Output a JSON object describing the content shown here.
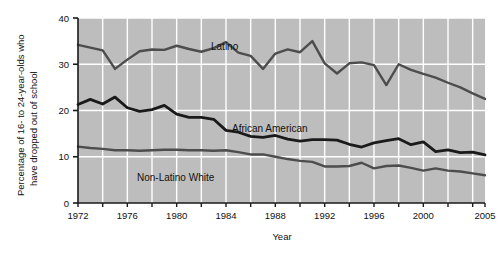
{
  "figure": {
    "background_color": "#ffffff",
    "plot_background_color": "#bdbdbd",
    "gridline_color": "#ffffff",
    "axis_color": "#1a1a1a"
  },
  "axes": {
    "y_title": "Percentage of 16- to 24-year-olds who have dropped out of school",
    "x_title": "Year",
    "y_ticks": [
      "0",
      "10",
      "20",
      "30",
      "40"
    ],
    "x_ticks": [
      "1972",
      "1976",
      "1980",
      "1984",
      "1988",
      "1992",
      "1996",
      "2000",
      "2005"
    ]
  },
  "series_labels": {
    "latino": "Latino",
    "african_american": "African American",
    "non_latino_white": "Non-Latino White"
  },
  "chart_data": {
    "type": "line",
    "title": "",
    "subtitle": "",
    "xlabel": "Year",
    "ylabel": "Percentage of 16- to 24-year-olds who have dropped out of school",
    "xlim": [
      1972,
      2005
    ],
    "ylim": [
      0,
      40
    ],
    "y_ticks": [
      0,
      10,
      20,
      30,
      40
    ],
    "x_ticks": [
      1972,
      1976,
      1980,
      1984,
      1988,
      1992,
      1996,
      2000,
      2005
    ],
    "grid": true,
    "grid_color": "#ffffff",
    "legend": "inline-annotations",
    "x": [
      1972,
      1973,
      1974,
      1975,
      1976,
      1977,
      1978,
      1979,
      1980,
      1981,
      1982,
      1983,
      1984,
      1985,
      1986,
      1987,
      1988,
      1989,
      1990,
      1991,
      1992,
      1993,
      1994,
      1995,
      1996,
      1997,
      1998,
      1999,
      2000,
      2001,
      2002,
      2003,
      2004,
      2005
    ],
    "series": [
      {
        "name": "Latino",
        "color": "#4d4d4d",
        "line_width": 2.4,
        "annotation": "Latino",
        "values": [
          34.2,
          33.6,
          33.0,
          29.0,
          31.0,
          32.8,
          33.2,
          33.1,
          34.0,
          33.3,
          32.7,
          33.5,
          34.8,
          32.5,
          31.8,
          29.0,
          32.3,
          33.2,
          32.6,
          35.0,
          30.2,
          28.0,
          30.2,
          30.4,
          29.8,
          25.5,
          30.0,
          28.8,
          27.9,
          27.1,
          26.0,
          25.0,
          23.7,
          22.5
        ]
      },
      {
        "name": "African American",
        "color": "#1a1a1a",
        "line_width": 2.8,
        "annotation": "African American",
        "values": [
          21.3,
          22.4,
          21.4,
          22.9,
          20.6,
          19.8,
          20.2,
          21.1,
          19.2,
          18.5,
          18.5,
          18.1,
          15.7,
          15.3,
          14.4,
          14.2,
          14.6,
          13.8,
          13.4,
          13.7,
          13.7,
          13.6,
          12.7,
          12.1,
          13.0,
          13.5,
          13.9,
          12.6,
          13.2,
          11.1,
          11.5,
          10.9,
          11.0,
          10.4
        ]
      },
      {
        "name": "Non-Latino White",
        "color": "#4d4d4d",
        "line_width": 2.4,
        "annotation": "Non-Latino White",
        "values": [
          12.2,
          11.9,
          11.7,
          11.4,
          11.4,
          11.3,
          11.4,
          11.5,
          11.5,
          11.4,
          11.4,
          11.3,
          11.4,
          11.0,
          10.5,
          10.5,
          10.0,
          9.5,
          9.1,
          8.9,
          7.9,
          7.9,
          8.0,
          8.7,
          7.5,
          8.0,
          8.1,
          7.6,
          7.0,
          7.5,
          7.0,
          6.8,
          6.4,
          6.0
        ]
      }
    ]
  }
}
